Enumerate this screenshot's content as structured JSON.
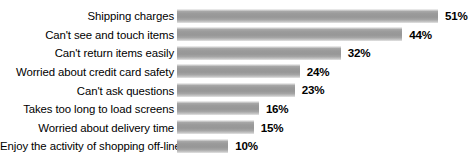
{
  "chart": {
    "type": "bar",
    "orientation": "horizontal",
    "title": "",
    "xlabel": "",
    "ylabel": "",
    "value_suffix": "%"
  },
  "chart_data": {
    "type": "bar",
    "orientation": "horizontal",
    "title": "",
    "subtitle": "",
    "xlabel": "",
    "ylabel": "",
    "xlim": [
      0,
      51
    ],
    "grid": false,
    "legend": false,
    "axis_visible": false,
    "data_labels": true,
    "categories": [
      "Shipping charges",
      "Can't see and touch items",
      "Can't return items easily",
      "Worried about credit card safety",
      "Can't ask questions",
      "Takes too long to load screens",
      "Worried about delivery time",
      "Enjoy the activity of shopping off-line"
    ],
    "values": [
      51,
      44,
      32,
      24,
      23,
      16,
      15,
      10
    ],
    "value_labels": [
      "51%",
      "44%",
      "32%",
      "24%",
      "23%",
      "16%",
      "15%",
      "10%"
    ],
    "bar_color": "#9a9a9a",
    "bar_gradient": [
      "#f2f2f2",
      "#9a9a9a",
      "#e4e4e4"
    ],
    "background_color": "#ffffff",
    "text_color": "#000000"
  },
  "rows": [
    {
      "label": "Shipping charges",
      "value": 51,
      "value_label": "51%"
    },
    {
      "label": "Can't see and touch items",
      "value": 44,
      "value_label": "44%"
    },
    {
      "label": "Can't return items easily",
      "value": 32,
      "value_label": "32%"
    },
    {
      "label": "Worried about credit card safety",
      "value": 24,
      "value_label": "24%"
    },
    {
      "label": "Can't ask questions",
      "value": 23,
      "value_label": "23%"
    },
    {
      "label": "Takes too long to load screens",
      "value": 16,
      "value_label": "16%"
    },
    {
      "label": "Worried about delivery time",
      "value": 15,
      "value_label": "15%"
    },
    {
      "label": "Enjoy the activity of shopping off-line",
      "value": 10,
      "value_label": "10%"
    }
  ]
}
